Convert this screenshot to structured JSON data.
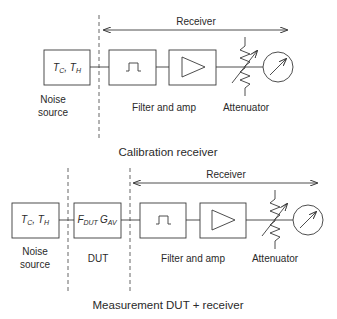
{
  "calibration": {
    "title": "Calibration receiver",
    "receiver_label": "Receiver",
    "noise_box": {
      "main": "T",
      "sub1": "C",
      "sep": ", ",
      "main2": "T",
      "sub2": "H"
    },
    "labels": {
      "noise_line1": "Noise",
      "noise_line2": "source",
      "filter_amp": "Filter and amp",
      "attenuator": "Attenuator"
    }
  },
  "measurement": {
    "title": "Measurement DUT + receiver",
    "receiver_label": "Receiver",
    "noise_box": {
      "main": "T",
      "sub1": "C",
      "sep": ", ",
      "main2": "T",
      "sub2": "H"
    },
    "dut_box": {
      "main": "F",
      "sub1": "DUT",
      "main2": "G",
      "sub2": "AV"
    },
    "labels": {
      "noise_line1": "Noise",
      "noise_line2": "source",
      "dut": "DUT",
      "filter_amp": "Filter and amp",
      "attenuator": "Attenuator"
    }
  },
  "icons": [
    "bandpass-filter-icon",
    "amplifier-triangle-icon",
    "variable-attenuator-icon",
    "power-meter-icon"
  ],
  "colors": {
    "stroke": "#3a3a3a",
    "text": "#2a2a2a",
    "background": "#ffffff"
  }
}
